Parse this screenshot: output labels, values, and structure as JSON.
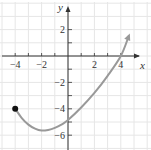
{
  "chart_data": {
    "type": "line",
    "title": "",
    "xlabel": "x",
    "ylabel": "y",
    "xlim": [
      -5,
      6
    ],
    "ylim": [
      -7,
      4
    ],
    "grid": true,
    "x_ticks": [
      -4,
      -3,
      -2,
      -1,
      1,
      2,
      3,
      4
    ],
    "x_tick_labels": [
      "-4",
      "-2",
      "2",
      "4"
    ],
    "x_tick_label_values": [
      -4,
      -2,
      2,
      4
    ],
    "y_ticks": [
      2,
      1,
      -1,
      -2,
      -3,
      -4,
      -5,
      -6
    ],
    "y_tick_labels": [
      "2",
      "-2",
      "-4",
      "-6"
    ],
    "y_tick_label_values": [
      2,
      -2,
      -4,
      -6
    ],
    "series": [
      {
        "name": "f(x)",
        "color": "#999999",
        "start_point": {
          "x": -4,
          "y": -4,
          "closed": true
        },
        "end": "arrow",
        "points": [
          {
            "x": -4,
            "y": -4
          },
          {
            "x": -3.5,
            "y": -4.7
          },
          {
            "x": -3,
            "y": -5.2
          },
          {
            "x": -2.5,
            "y": -5.5
          },
          {
            "x": -2,
            "y": -5.65
          },
          {
            "x": -1.5,
            "y": -5.6
          },
          {
            "x": -1,
            "y": -5.45
          },
          {
            "x": -0.5,
            "y": -5.2
          },
          {
            "x": 0,
            "y": -4.85
          },
          {
            "x": 1,
            "y": -3.9
          },
          {
            "x": 2,
            "y": -2.8
          },
          {
            "x": 3,
            "y": -1.5
          },
          {
            "x": 4,
            "y": 0
          },
          {
            "x": 4.6,
            "y": 1.5
          }
        ]
      }
    ],
    "legend": null
  },
  "axes": {
    "x_label": "x",
    "y_label": "y"
  },
  "colors": {
    "grid": "#e6e6e6",
    "axis": "#333333",
    "curve": "#999999",
    "point": "#111111"
  }
}
